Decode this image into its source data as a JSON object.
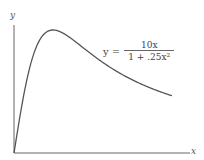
{
  "chart_data": {
    "type": "line",
    "title": "",
    "xlabel": "x",
    "ylabel": "y",
    "function": "y = 10x / (1 + .25x^2)",
    "annotation": {
      "lhs": "y =",
      "numerator": "10x",
      "denominator": "1 + .25x²"
    },
    "x": [
      0,
      0.5,
      1,
      1.5,
      2,
      3,
      4,
      5,
      6,
      7,
      8
    ],
    "values": [
      0,
      4.71,
      8.0,
      9.6,
      10.0,
      9.23,
      8.0,
      6.9,
      6.0,
      5.28,
      4.71
    ],
    "xlim": [
      0,
      9.5
    ],
    "ylim": [
      0,
      12
    ],
    "grid": false,
    "ticks": false
  }
}
